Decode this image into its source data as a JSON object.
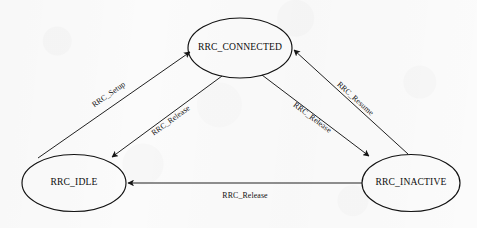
{
  "diagram": {
    "kind": "state-machine",
    "width": 477,
    "height": 228,
    "background_color": "#fbfbfb",
    "stroke_color": "#151515",
    "text_color": "#0d0d0d",
    "states": [
      {
        "id": "connected",
        "label": "RRC_CONNECTED",
        "cx": 240,
        "cy": 48,
        "rx": 52,
        "ry": 30
      },
      {
        "id": "idle",
        "label": "RRC_IDLE",
        "cx": 74,
        "cy": 183,
        "rx": 52,
        "ry": 28.5
      },
      {
        "id": "inactive",
        "label": "RRC_INACTIVE",
        "cx": 411,
        "cy": 183,
        "rx": 49,
        "ry": 28.5
      }
    ],
    "transitions": [
      {
        "id": "idle-to-connected",
        "label": "RRC_Setup",
        "from": "idle",
        "to": "connected",
        "x1": 38,
        "y1": 158,
        "x2": 190,
        "y2": 52,
        "label_x": 109,
        "label_y": 95,
        "label_rotation": -35
      },
      {
        "id": "connected-to-idle",
        "label": "RRC_Release",
        "from": "connected",
        "to": "idle",
        "x1": 222,
        "y1": 76,
        "x2": 112,
        "y2": 157,
        "label_x": 171,
        "label_y": 121,
        "label_rotation": -36
      },
      {
        "id": "connected-to-inactive",
        "label": "RRC_Release",
        "from": "connected",
        "to": "inactive",
        "x1": 262,
        "y1": 75,
        "x2": 369,
        "y2": 156,
        "label_x": 312,
        "label_y": 118,
        "label_rotation": 37
      },
      {
        "id": "inactive-to-connected",
        "label": "RRC_Resume",
        "from": "inactive",
        "to": "connected",
        "x1": 408,
        "y1": 154,
        "x2": 294,
        "y2": 50,
        "label_x": 355,
        "label_y": 99,
        "label_rotation": 42
      },
      {
        "id": "inactive-to-idle",
        "label": "RRC_Release",
        "from": "inactive",
        "to": "idle",
        "x1": 362,
        "y1": 183,
        "x2": 128,
        "y2": 183,
        "label_x": 245,
        "label_y": 196,
        "label_rotation": 0
      }
    ]
  }
}
